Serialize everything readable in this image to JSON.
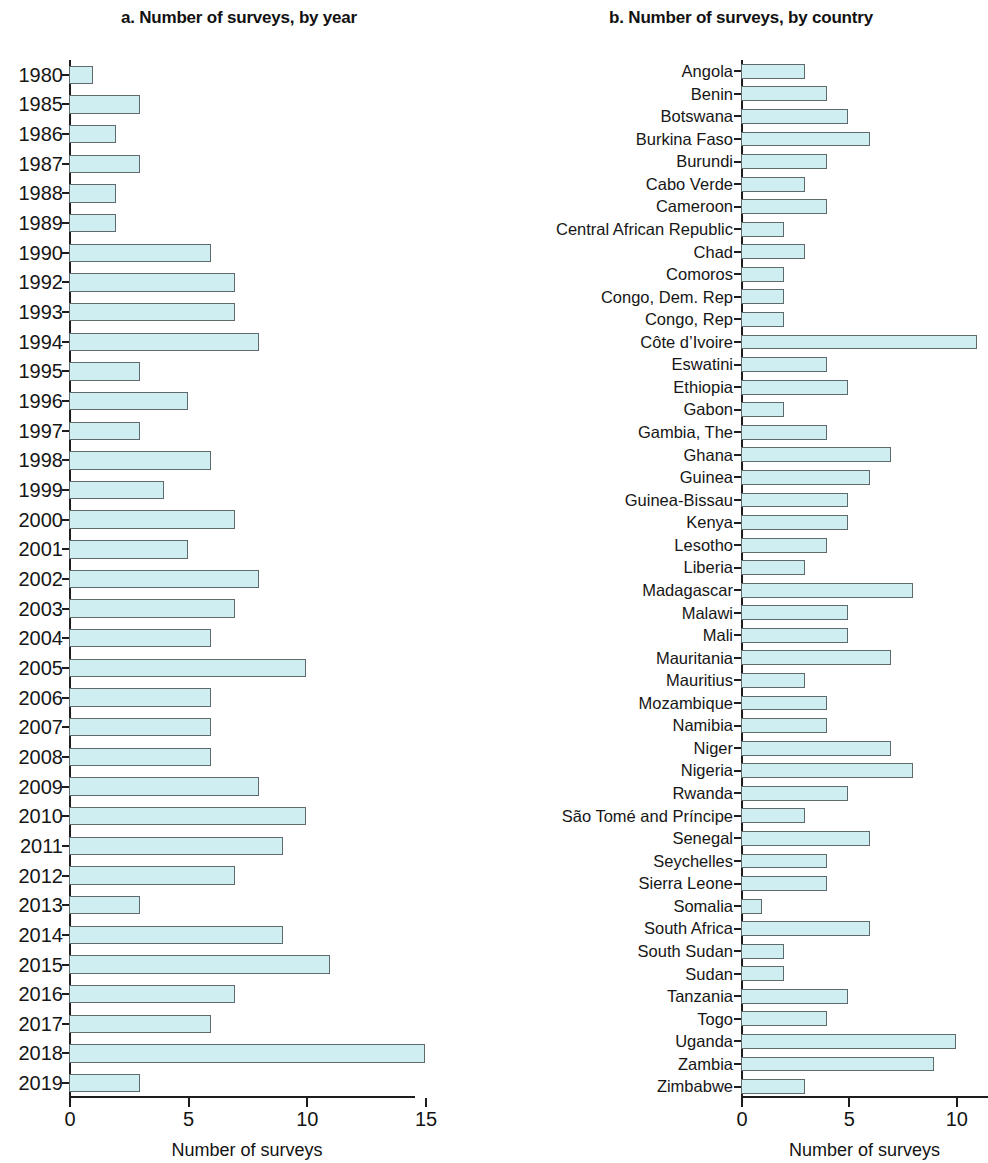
{
  "figure": {
    "background": "#ffffff",
    "bar_fill": "#ceeef2",
    "bar_stroke": "#5e6a6c",
    "axis_color": "#1d1d1d"
  },
  "panel_a": {
    "title": "a. Number of surveys, by year",
    "xaxis_title": "Number of surveys",
    "xticks": [
      "0",
      "5",
      "10",
      "15"
    ]
  },
  "panel_b": {
    "title": "b. Number of surveys, by country",
    "xaxis_title": "Number of surveys",
    "xticks": [
      "0",
      "5",
      "10"
    ]
  },
  "chart_data": [
    {
      "type": "bar",
      "orientation": "horizontal",
      "title": "a. Number of surveys, by year",
      "xlabel": "Number of surveys",
      "ylabel": "",
      "xlim": [
        0,
        15
      ],
      "xticks": [
        0,
        5,
        10,
        15
      ],
      "grid": false,
      "legend": "none",
      "categories": [
        "1980",
        "1985",
        "1986",
        "1987",
        "1988",
        "1989",
        "1990",
        "1992",
        "1993",
        "1994",
        "1995",
        "1996",
        "1997",
        "1998",
        "1999",
        "2000",
        "2001",
        "2002",
        "2003",
        "2004",
        "2005",
        "2006",
        "2007",
        "2008",
        "2009",
        "2010",
        "2011",
        "2012",
        "2013",
        "2014",
        "2015",
        "2016",
        "2017",
        "2018",
        "2019"
      ],
      "values": [
        1,
        3,
        2,
        3,
        2,
        2,
        6,
        7,
        7,
        8,
        3,
        5,
        3,
        6,
        4,
        7,
        5,
        8,
        7,
        6,
        10,
        6,
        6,
        6,
        8,
        10,
        9,
        7,
        3,
        9,
        11,
        7,
        6,
        15,
        3
      ]
    },
    {
      "type": "bar",
      "orientation": "horizontal",
      "title": "b. Number of surveys, by country",
      "xlabel": "Number of surveys",
      "ylabel": "",
      "xlim": [
        0,
        11.5
      ],
      "xticks": [
        0,
        5,
        10
      ],
      "grid": false,
      "legend": "none",
      "categories": [
        "Angola",
        "Benin",
        "Botswana",
        "Burkina Faso",
        "Burundi",
        "Cabo Verde",
        "Cameroon",
        "Central African Republic",
        "Chad",
        "Comoros",
        "Congo, Dem. Rep",
        "Congo, Rep",
        "Côte d’Ivoire",
        "Eswatini",
        "Ethiopia",
        "Gabon",
        "Gambia, The",
        "Ghana",
        "Guinea",
        "Guinea-Bissau",
        "Kenya",
        "Lesotho",
        "Liberia",
        "Madagascar",
        "Malawi",
        "Mali",
        "Mauritania",
        "Mauritius",
        "Mozambique",
        "Namibia",
        "Niger",
        "Nigeria",
        "Rwanda",
        "São Tomé and Príncipe",
        "Senegal",
        "Seychelles",
        "Sierra Leone",
        "Somalia",
        "South Africa",
        "South Sudan",
        "Sudan",
        "Tanzania",
        "Togo",
        "Uganda",
        "Zambia",
        "Zimbabwe"
      ],
      "values": [
        3,
        4,
        5,
        6,
        4,
        3,
        4,
        2,
        3,
        2,
        2,
        2,
        11,
        4,
        5,
        2,
        4,
        7,
        6,
        5,
        5,
        4,
        3,
        8,
        5,
        5,
        7,
        3,
        4,
        4,
        7,
        8,
        5,
        3,
        6,
        4,
        4,
        1,
        6,
        2,
        2,
        5,
        4,
        10,
        9,
        3
      ]
    }
  ]
}
